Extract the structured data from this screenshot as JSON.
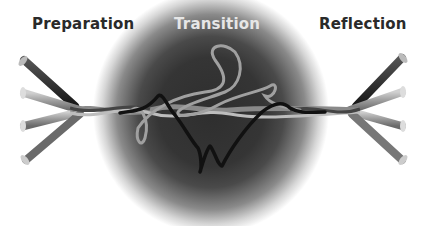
{
  "headings": {
    "preparation": "Preparation",
    "transition": "Transition",
    "reflection": "Reflection"
  },
  "colors": {
    "center_dark": "#2e2e2e",
    "edge": "#ffffff",
    "heading_dark": "#2a2a2a",
    "heading_light": "#e6e6e6",
    "strand_black": "#111111",
    "strand_grey": "#9a9a9a"
  },
  "diagram": {
    "left_tubes": 4,
    "right_tubes": 4,
    "tube_labels_legible": false
  }
}
